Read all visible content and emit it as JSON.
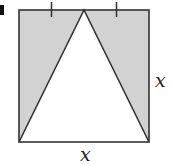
{
  "figure": {
    "part_label": "a",
    "side_label_right": "x",
    "side_label_bottom": "x",
    "shading_color": "#d2d2d2",
    "line_color": "#333333"
  }
}
